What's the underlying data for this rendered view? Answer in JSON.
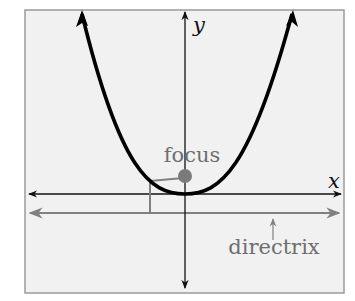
{
  "diagram": {
    "axes": {
      "x_label": "x",
      "y_label": "y"
    },
    "labels": {
      "focus": "focus",
      "directrix": "directrix"
    },
    "colors": {
      "background": "#f1f1f1",
      "frame": "#9a9a9a",
      "curve": "#000000",
      "axes": "#111111",
      "focus_point": "#7a7a7a",
      "directrix": "#808080",
      "label_gray": "#6e6e6e"
    },
    "elements": [
      "parabola (opens upward, vertex at origin)",
      "focus point above vertex",
      "directrix line below x-axis",
      "perpendicular segment from parabola point to directrix",
      "segment from parabola point to focus"
    ]
  }
}
